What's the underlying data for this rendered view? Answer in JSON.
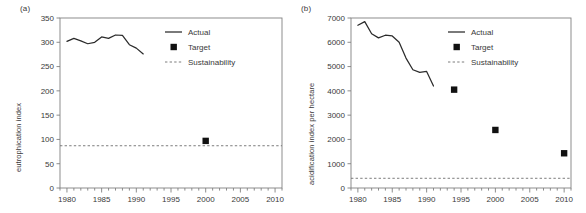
{
  "figure": {
    "panels": [
      {
        "id": "a",
        "label": "(a)",
        "chart_data": {
          "type": "line",
          "title": "",
          "xlabel": "",
          "ylabel": "eutrophication index",
          "xlim": [
            1979,
            2011
          ],
          "ylim": [
            0,
            350
          ],
          "ytick_step": 50,
          "xtick_step": 5,
          "xminor_step": 1,
          "grid": false,
          "legend_position": "upper-right",
          "yticks": [
            "0",
            "50",
            "100",
            "150",
            "200",
            "250",
            "300",
            "350"
          ],
          "xticks": [
            "1980",
            "1985",
            "1990",
            "1995",
            "2000",
            "2005",
            "2010"
          ],
          "series": [
            {
              "name": "Actual",
              "type": "line",
              "x": [
                1980,
                1981,
                1982,
                1983,
                1984,
                1985,
                1986,
                1987,
                1988,
                1989,
                1990,
                1991
              ],
              "values": [
                302,
                308,
                303,
                297,
                300,
                311,
                308,
                315,
                314,
                295,
                288,
                276,
                275
              ]
            },
            {
              "name": "Target",
              "type": "scatter",
              "x": [
                2000
              ],
              "values": [
                97
              ]
            },
            {
              "name": "Sustainability",
              "type": "hline",
              "values": [
                87
              ]
            }
          ],
          "legend": [
            {
              "label": "Actual",
              "marker": "line"
            },
            {
              "label": "Target",
              "marker": "square"
            },
            {
              "label": "Sustainability",
              "marker": "dotted-line"
            }
          ]
        }
      },
      {
        "id": "b",
        "label": "(b)",
        "chart_data": {
          "type": "line",
          "title": "",
          "xlabel": "",
          "ylabel": "acidification index per hectare",
          "xlim": [
            1979,
            2011
          ],
          "ylim": [
            0,
            7000
          ],
          "ytick_step": 1000,
          "xtick_step": 5,
          "xminor_step": 1,
          "grid": false,
          "legend_position": "upper-right",
          "yticks": [
            "0",
            "1000",
            "2000",
            "3000",
            "4000",
            "5000",
            "6000",
            "7000"
          ],
          "xticks": [
            "1980",
            "1985",
            "1990",
            "1995",
            "2000",
            "2005",
            "2010"
          ],
          "series": [
            {
              "name": "Actual",
              "type": "line",
              "x": [
                1980,
                1981,
                1982,
                1983,
                1984,
                1985,
                1986,
                1987,
                1988,
                1989,
                1990,
                1991
              ],
              "values": [
                6700,
                6850,
                6350,
                6180,
                6290,
                6260,
                6000,
                5350,
                4870,
                4760,
                4800,
                4200
              ]
            },
            {
              "name": "Target",
              "type": "scatter",
              "x": [
                1994,
                2000,
                2010
              ],
              "values": [
                4050,
                2390,
                1430
              ]
            },
            {
              "name": "Sustainability",
              "type": "hline",
              "values": [
                400
              ]
            }
          ],
          "legend": [
            {
              "label": "Actual",
              "marker": "line"
            },
            {
              "label": "Target",
              "marker": "square"
            },
            {
              "label": "Sustainability",
              "marker": "dotted-line"
            }
          ]
        }
      }
    ],
    "colors": {
      "line": "#2b2b2b",
      "text": "#3a3a3a",
      "axis": "#808080",
      "sustainability": "#6e6e6e",
      "marker": "#111111",
      "background": "#ffffff"
    }
  }
}
